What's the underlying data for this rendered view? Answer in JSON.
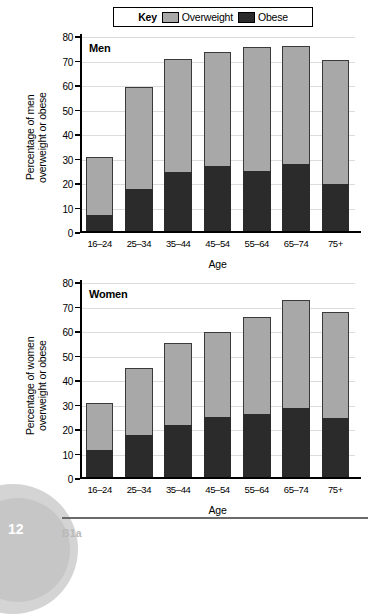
{
  "legend": {
    "key_label": "Key",
    "entries": [
      {
        "label": "Overweight",
        "color": "#a8a8a8",
        "icon": "legend-swatch-overweight"
      },
      {
        "label": "Obese",
        "color": "#2b2b2b",
        "icon": "legend-swatch-obese"
      }
    ]
  },
  "footer": {
    "page_number": "12",
    "code": "B1a"
  },
  "chart_data": [
    {
      "type": "bar",
      "stacked": true,
      "title": "Men",
      "xlabel": "Age",
      "ylabel": "Percentage of men\novergweight or obese",
      "ylabel_text": "Percentage of men\noverweight or obese",
      "categories": [
        "16–24",
        "25–34",
        "35–44",
        "45–54",
        "55–64",
        "65–74",
        "75+"
      ],
      "ylim": [
        0,
        80
      ],
      "yticks": [
        0,
        10,
        20,
        30,
        40,
        50,
        60,
        70,
        80
      ],
      "ytick_labels": [
        "0",
        "10",
        "20",
        "30",
        "40",
        "50",
        "60",
        "70",
        "80"
      ],
      "grid": true,
      "legend_position": "above-plot",
      "series": [
        {
          "name": "Obese",
          "color": "#2b2b2b",
          "values": [
            7.5,
            18,
            25,
            27.5,
            25.5,
            28,
            20
          ]
        },
        {
          "name": "Overweight",
          "color": "#a8a8a8",
          "values": [
            23.5,
            41.5,
            46,
            46.5,
            50.5,
            48.5,
            50.5
          ]
        }
      ],
      "totals": [
        31,
        59.5,
        71,
        74,
        76,
        76.5,
        70.5
      ]
    },
    {
      "type": "bar",
      "stacked": true,
      "title": "Women",
      "xlabel": "Age",
      "ylabel_text": "Percentage of women\noverweight or obese",
      "categories": [
        "16–24",
        "25–34",
        "35–44",
        "45–54",
        "55–64",
        "65–74",
        "75+"
      ],
      "ylim": [
        0,
        80
      ],
      "yticks": [
        0,
        10,
        20,
        30,
        40,
        50,
        60,
        70,
        80
      ],
      "ytick_labels": [
        "0",
        "10",
        "20",
        "30",
        "40",
        "50",
        "60",
        "70",
        "80"
      ],
      "grid": true,
      "legend_position": "above-plot",
      "series": [
        {
          "name": "Obese",
          "color": "#2b2b2b",
          "values": [
            12,
            18,
            22,
            25.5,
            26.5,
            29,
            25
          ]
        },
        {
          "name": "Overweight",
          "color": "#a8a8a8",
          "values": [
            19,
            27.5,
            33.5,
            34.5,
            39.5,
            44,
            43
          ]
        }
      ],
      "totals": [
        31,
        45.5,
        55.5,
        60,
        66,
        73,
        68
      ]
    }
  ]
}
